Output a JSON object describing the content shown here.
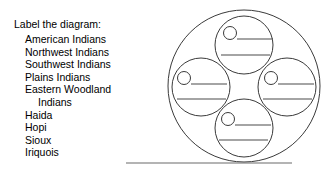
{
  "worksheet": {
    "instruction": "Label the diagram:",
    "terms": [
      {
        "label": "American Indians",
        "continuation": false
      },
      {
        "label": "Northwest Indians",
        "continuation": false
      },
      {
        "label": "Southwest Indians",
        "continuation": false
      },
      {
        "label": "Plains Indians",
        "continuation": false
      },
      {
        "label": "Eastern Woodland",
        "continuation": false
      },
      {
        "label": "Indians",
        "continuation": true
      },
      {
        "label": "Haida",
        "continuation": false
      },
      {
        "label": "Hopi",
        "continuation": false
      },
      {
        "label": "Sioux",
        "continuation": false
      },
      {
        "label": "Iriquois",
        "continuation": false
      }
    ]
  },
  "diagram": {
    "type": "concept-map-blank",
    "stroke_color": "#3a3a3a",
    "rule_color": "#4a4a4a",
    "baseline_color": "#6b6b6b",
    "outer_circle": {
      "cx": 244,
      "cy": 86,
      "r": 76
    },
    "inner_circles": [
      {
        "name": "top",
        "cx": 244,
        "cy": 45,
        "r": 29,
        "bullet": {
          "cx": 230,
          "cy": 33,
          "r": 6.5
        },
        "rules": [
          {
            "x1": 237,
            "y1": 39,
            "x2": 273,
            "y2": 39
          },
          {
            "x1": 221,
            "y1": 55,
            "x2": 270,
            "y2": 55
          }
        ]
      },
      {
        "name": "left",
        "cx": 201,
        "cy": 87,
        "r": 29,
        "bullet": {
          "cx": 184,
          "cy": 78,
          "r": 6.5
        },
        "rules": [
          {
            "x1": 191,
            "y1": 84,
            "x2": 227,
            "y2": 84
          },
          {
            "x1": 177,
            "y1": 99,
            "x2": 226,
            "y2": 99
          }
        ]
      },
      {
        "name": "right",
        "cx": 287,
        "cy": 87,
        "r": 29,
        "bullet": {
          "cx": 271,
          "cy": 78,
          "r": 6.5
        },
        "rules": [
          {
            "x1": 278,
            "y1": 84,
            "x2": 314,
            "y2": 84
          },
          {
            "x1": 263,
            "y1": 99,
            "x2": 312,
            "y2": 99
          }
        ]
      },
      {
        "name": "bottom",
        "cx": 244,
        "cy": 128,
        "r": 29,
        "bullet": {
          "cx": 228,
          "cy": 119,
          "r": 6.5
        },
        "rules": [
          {
            "x1": 235,
            "y1": 125,
            "x2": 271,
            "y2": 125
          },
          {
            "x1": 219,
            "y1": 140,
            "x2": 268,
            "y2": 140
          }
        ]
      }
    ],
    "baseline": {
      "x1": 126,
      "y1": 163,
      "x2": 292,
      "y2": 163
    }
  }
}
